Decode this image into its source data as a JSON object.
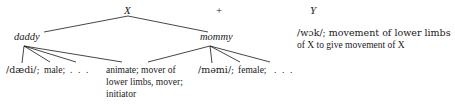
{
  "figure": {
    "type": "linguistic-feature-tree",
    "top_row": {
      "x_node": "X",
      "operator": "+",
      "y_node": "Y"
    },
    "mid_row": {
      "left_node": "daddy",
      "right_node": "mommy"
    },
    "leaves": {
      "daddy_phonetic": "/dædi/;",
      "daddy_feature_1": "male;",
      "daddy_ellipsis": ". . .",
      "mommy_phonetic": "/məmi/;",
      "mommy_feature_1": "female;",
      "mommy_ellipsis": ". . ."
    },
    "shared_block": {
      "line_1": "animate; mover of",
      "line_2": "lower limbs, mover;",
      "line_3": "initiator"
    },
    "y_gloss": {
      "line_1": "/wɔk/; movement of lower limbs",
      "line_2": "of X to give movement of X"
    },
    "colors": {
      "ink": "#1a1a1a",
      "line": "#17171a",
      "background": "#ffffff"
    }
  }
}
